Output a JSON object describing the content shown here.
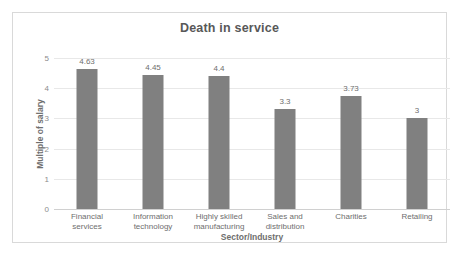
{
  "chart_data": {
    "type": "bar",
    "title": "Death in service",
    "xlabel": "Sector/Industry",
    "ylabel": "Multiple of salary",
    "categories": [
      "Financial services",
      "Information technology",
      "Highly skilled manufacturing",
      "Sales and distribution",
      "Charities",
      "Retailing"
    ],
    "category_lines": [
      [
        "Financial",
        "services"
      ],
      [
        "Information",
        "technology"
      ],
      [
        "Highly skilled",
        "manufacturing"
      ],
      [
        "Sales and",
        "distribution"
      ],
      [
        "Charities"
      ],
      [
        "Retailing"
      ]
    ],
    "values": [
      4.63,
      4.45,
      4.4,
      3.3,
      3.73,
      3
    ],
    "value_labels": [
      "4.63",
      "4.45",
      "4.4",
      "3.3",
      "3.73",
      "3"
    ],
    "ylim": [
      0,
      5
    ],
    "yticks": [
      0,
      1,
      2,
      3,
      4,
      5
    ],
    "ytick_labels": [
      "0",
      "1",
      "2",
      "3",
      "4",
      "5"
    ],
    "grid": true,
    "legend": false,
    "bar_color": "#808080",
    "gridline_color": "#e8e8e8",
    "text_color": "#6e6e6e",
    "title_color": "#585858",
    "frame_color": "#d9d9d9",
    "background": "#ffffff"
  }
}
